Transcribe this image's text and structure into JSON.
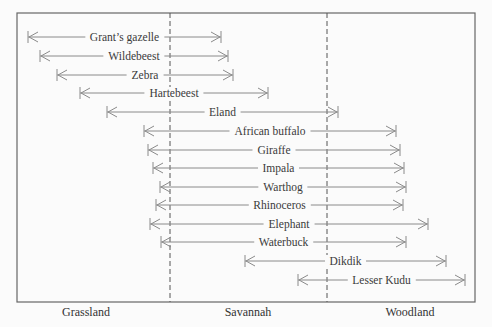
{
  "chart_data": {
    "type": "range",
    "title": "",
    "zones": [
      {
        "label": "Grassland",
        "x_center": 86
      },
      {
        "label": "Savannah",
        "x_center": 248
      },
      {
        "label": "Woodland",
        "x_center": 410
      }
    ],
    "boundaries": [
      170,
      327
    ],
    "frame": {
      "left": 17,
      "top": 13,
      "right": 475,
      "bottom": 302
    },
    "species": [
      {
        "name": "Grant’s gazelle",
        "start": 28,
        "end": 221,
        "y": 37
      },
      {
        "name": "Wildebeest",
        "start": 40,
        "end": 228,
        "y": 56
      },
      {
        "name": "Zebra",
        "start": 57,
        "end": 233,
        "y": 75
      },
      {
        "name": "Hartebeest",
        "start": 80,
        "end": 268,
        "y": 93
      },
      {
        "name": "Eland",
        "start": 107,
        "end": 338,
        "y": 112
      },
      {
        "name": "African buffalo",
        "start": 144,
        "end": 396,
        "y": 131
      },
      {
        "name": "Giraffe",
        "start": 148,
        "end": 400,
        "y": 150
      },
      {
        "name": "Impala",
        "start": 153,
        "end": 404,
        "y": 168
      },
      {
        "name": "Warthog",
        "start": 160,
        "end": 406,
        "y": 187
      },
      {
        "name": "Rhinoceros",
        "start": 156,
        "end": 403,
        "y": 205
      },
      {
        "name": "Elephant",
        "start": 150,
        "end": 428,
        "y": 224
      },
      {
        "name": "Waterbuck",
        "start": 161,
        "end": 406,
        "y": 242
      },
      {
        "name": "Dikdik",
        "start": 245,
        "end": 446,
        "y": 261
      },
      {
        "name": "Lesser Kudu",
        "start": 298,
        "end": 465,
        "y": 280
      }
    ]
  },
  "colors": {
    "frame": "#666666",
    "arrow": "#8a8a8a",
    "text": "#3a3a3a",
    "dash": "#555555"
  }
}
